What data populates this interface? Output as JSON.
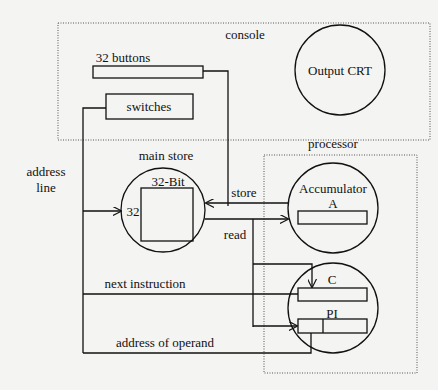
{
  "diagram": {
    "groups": {
      "console": "console",
      "processor": "processor"
    },
    "console": {
      "buttons_label": "32 buttons",
      "switches_label": "switches",
      "output_label": "Output CRT"
    },
    "main_store": {
      "title": "main store",
      "width_label": "32-Bit",
      "address_width": "32"
    },
    "processor": {
      "accumulator_line1": "Accumulator",
      "accumulator_line2": "A",
      "c_label": "C",
      "pi_label": "PI"
    },
    "connections": {
      "address_line_1": "address",
      "address_line_2": "line",
      "store": "store",
      "read": "read",
      "next_instruction": "next instruction",
      "address_of_operand": "address of operand"
    }
  }
}
